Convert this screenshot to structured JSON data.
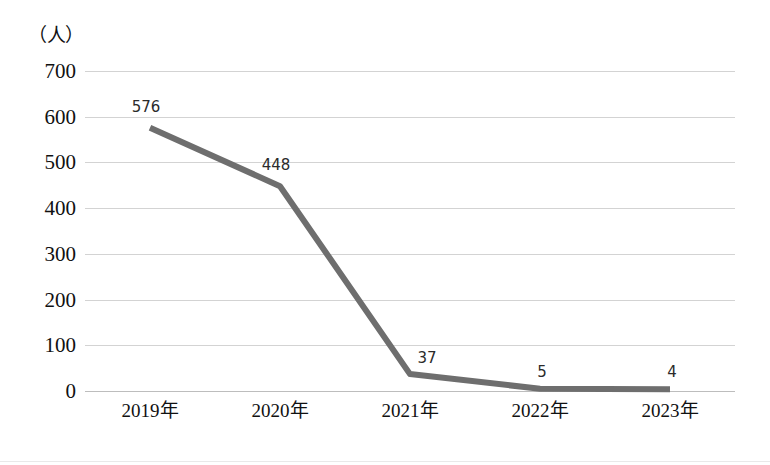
{
  "chart_data": {
    "type": "line",
    "title": "",
    "subtitle": "",
    "xlabel": "",
    "ylabel": "（人）",
    "unit_label": "（人）",
    "categories": [
      "2019年",
      "2020年",
      "2021年",
      "2022年",
      "2023年"
    ],
    "values": [
      576,
      448,
      37,
      5,
      4
    ],
    "point_labels": [
      "576",
      "448",
      "37",
      "5",
      "4"
    ],
    "ylim": [
      0,
      700
    ],
    "y_ticks": [
      "0",
      "100",
      "200",
      "300",
      "400",
      "500",
      "600",
      "700"
    ],
    "y_tick_values": [
      0,
      100,
      200,
      300,
      400,
      500,
      600,
      700
    ],
    "grid": true,
    "grid_axis": "y",
    "legend": "none",
    "series": [
      {
        "name": "",
        "values": [
          576,
          448,
          37,
          5,
          4
        ],
        "color": "#6e6e6e",
        "marker": "none",
        "line_width": 6
      }
    ],
    "colors": {
      "line": "#6e6e6e",
      "grid": "#d3d3d3",
      "zero_line": "#bdbdbd",
      "text": "#111111",
      "label_text": "#2b2b2b",
      "background": "#ffffff"
    }
  }
}
